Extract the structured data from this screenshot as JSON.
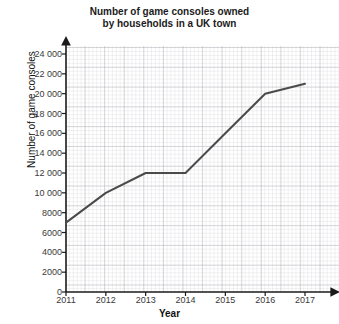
{
  "chart_data": {
    "type": "line",
    "title": "Number of game consoles owned by households in a UK town",
    "title_lines": [
      "Number of game consoles owned",
      "by households in a UK town"
    ],
    "xlabel": "Year",
    "ylabel": "Number of game consoles",
    "x": [
      2011,
      2012,
      2013,
      2014,
      2015,
      2016,
      2017
    ],
    "values": [
      7000,
      10000,
      12000,
      12000,
      16000,
      20000,
      21000
    ],
    "xtick_labels": [
      "2011",
      "2012",
      "2013",
      "2014",
      "2015",
      "2016",
      "2017"
    ],
    "ytick_values": [
      0,
      2000,
      4000,
      6000,
      8000,
      10000,
      12000,
      14000,
      16000,
      18000,
      20000,
      22000,
      24000
    ],
    "ytick_labels": [
      "0",
      "2000",
      "4000",
      "6000",
      "8000",
      "10 000",
      "12 000",
      "14 000",
      "16 000",
      "18 000",
      "20 000",
      "22 000",
      "24 000"
    ],
    "xlim": [
      2011,
      2017
    ],
    "ylim": [
      0,
      24000
    ],
    "grid": true,
    "grid_minor": true,
    "legend": null,
    "line_color": "#4a4a4a",
    "line_width": 2,
    "markers": false,
    "axis_color": "#1a1a1a",
    "grid_color": "#9a9aa4",
    "background": "#ffffff"
  }
}
